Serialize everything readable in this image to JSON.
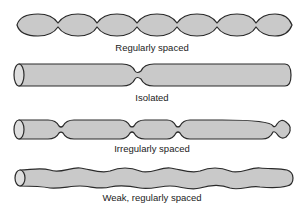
{
  "figure": {
    "panels": [
      {
        "id": "regular",
        "label": "Regularly spaced"
      },
      {
        "id": "isolated",
        "label": "Isolated"
      },
      {
        "id": "irregular",
        "label": "Irregularly spaced"
      },
      {
        "id": "weak",
        "label": "Weak, regularly spaced"
      }
    ],
    "colors": {
      "fill": "#c9c9c9",
      "stroke": "#2a2a2a",
      "background": "#ffffff"
    }
  }
}
